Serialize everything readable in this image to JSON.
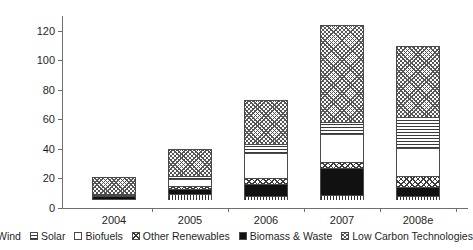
{
  "chart_data": {
    "type": "bar",
    "title": "",
    "subtitle": "",
    "xlabel": "",
    "ylabel": "",
    "stacked": true,
    "grid": false,
    "legend_position": "bottom",
    "categories": [
      "2004",
      "2005",
      "2006",
      "2007",
      "2008e"
    ],
    "ylim": [
      0,
      130
    ],
    "yticks": [
      0,
      20,
      40,
      60,
      80,
      100,
      120
    ],
    "ytick_labels": [
      "0",
      "20",
      "40",
      "60",
      "80",
      "100",
      "120"
    ],
    "series": [
      {
        "name": "Wind",
        "pattern": "vertical-stripes",
        "values": [
          0.5,
          4.0,
          3.0,
          3.5,
          3.0
        ]
      },
      {
        "name": "Biomass & Waste",
        "pattern": "solid-black",
        "values": [
          2.0,
          3.5,
          8.0,
          18.0,
          6.0
        ]
      },
      {
        "name": "Other Renewables",
        "pattern": "diagonal-crosshatch",
        "values": [
          0.5,
          2.0,
          4.0,
          4.0,
          7.0
        ]
      },
      {
        "name": "Biofuels",
        "pattern": "white",
        "values": [
          0.5,
          5.0,
          17.0,
          19.0,
          19.0
        ]
      },
      {
        "name": "Solar",
        "pattern": "horizontal-lines",
        "values": [
          0.5,
          2.0,
          6.0,
          8.0,
          21.0
        ]
      },
      {
        "name": "Low Carbon Technologies",
        "pattern": "fine-crosshatch",
        "values": [
          11.5,
          18.0,
          30.0,
          66.0,
          48.0
        ]
      }
    ],
    "totals": [
      15.5,
      34.5,
      68.0,
      118.5,
      104.0
    ]
  },
  "legend": {
    "items": [
      {
        "label": "Wind",
        "swatch": "vertical-stripes-swatch"
      },
      {
        "label": "Solar",
        "swatch": "horizontal-lines-swatch"
      },
      {
        "label": "Biofuels",
        "swatch": "white-swatch"
      },
      {
        "label": "Other Renewables",
        "swatch": "diagonal-crosshatch-swatch"
      },
      {
        "label": "Biomass & Waste",
        "swatch": "solid-black-swatch"
      },
      {
        "label": "Low Carbon Technologies",
        "swatch": "fine-crosshatch-swatch"
      }
    ]
  }
}
